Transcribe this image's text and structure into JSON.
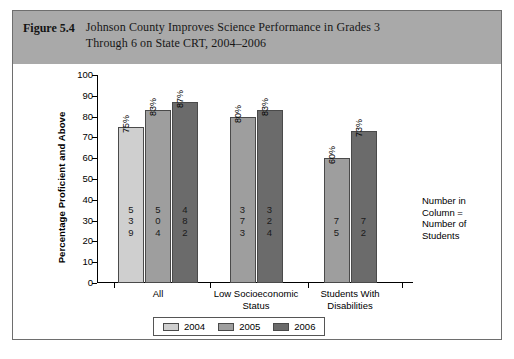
{
  "figure": {
    "number_label": "Figure 5.4",
    "title": "Johnson County Improves Science Performance in Grades 3 Through 6 on State CRT, 2004–2006",
    "title_line1": "Johnson County Improves Science Performance in Grades 3",
    "title_line2": "Through 6 on State CRT, 2004–2006",
    "header_bg": "#a9a9a9"
  },
  "annotation": {
    "line1": "Number in",
    "line2": "Column =",
    "line3": "Number of",
    "line4": "Students"
  },
  "legend": {
    "position": "bottom-center",
    "items": [
      {
        "label": "2004",
        "color": "#cfcfcf"
      },
      {
        "label": "2005",
        "color": "#9e9e9e"
      },
      {
        "label": "2006",
        "color": "#6b6b6b"
      }
    ]
  },
  "chart_data": {
    "type": "bar",
    "title": "Johnson County Improves Science Performance in Grades 3 Through 6 on State CRT, 2004–2006",
    "xlabel": "",
    "ylabel": "Percentage Proficient and Above",
    "ylim": [
      0,
      100
    ],
    "ytick_values": [
      100,
      90,
      80,
      70,
      60,
      50,
      40,
      30,
      20,
      10,
      0
    ],
    "ytick_labels": [
      "100",
      "90",
      "80",
      "70",
      "60",
      "50",
      "40",
      "30",
      "20",
      "10",
      "0"
    ],
    "grid": false,
    "categories": [
      "All",
      "Low Socioeconomic Status",
      "Students With Disabilities"
    ],
    "category_label_lines": [
      [
        "All"
      ],
      [
        "Low Socioeconomic",
        "Status"
      ],
      [
        "Students With",
        "Disabilities"
      ]
    ],
    "series": [
      {
        "name": "2004",
        "color": "#cfcfcf",
        "values": [
          75,
          null,
          null
        ],
        "data_labels": [
          "75%",
          null,
          null
        ],
        "counts": [
          539,
          null,
          null
        ],
        "count_digits": [
          [
            "5",
            "3",
            "9"
          ],
          null,
          null
        ]
      },
      {
        "name": "2005",
        "color": "#9e9e9e",
        "values": [
          83,
          80,
          60
        ],
        "data_labels": [
          "83%",
          "80%",
          "60%"
        ],
        "counts": [
          504,
          373,
          75
        ],
        "count_digits": [
          [
            "5",
            "0",
            "4"
          ],
          [
            "3",
            "7",
            "3"
          ],
          [
            "7",
            "5"
          ]
        ]
      },
      {
        "name": "2006",
        "color": "#6b6b6b",
        "values": [
          87,
          83,
          73
        ],
        "data_labels": [
          "87%",
          "83%",
          "83%"
        ],
        "counts": [
          482,
          324,
          72
        ],
        "count_digits": [
          [
            "4",
            "8",
            "2"
          ],
          [
            "3",
            "2",
            "4"
          ],
          [
            "7",
            "2"
          ]
        ]
      }
    ],
    "bars": [
      {
        "group": "All",
        "series": "2004",
        "value": 75,
        "label": "75%",
        "count": 539,
        "count_digits": [
          "5",
          "3",
          "9"
        ],
        "color": "#cfcfcf"
      },
      {
        "group": "All",
        "series": "2005",
        "value": 83,
        "label": "83%",
        "count": 504,
        "count_digits": [
          "5",
          "0",
          "4"
        ],
        "color": "#9e9e9e"
      },
      {
        "group": "All",
        "series": "2006",
        "value": 87,
        "label": "87%",
        "count": 482,
        "count_digits": [
          "4",
          "8",
          "2"
        ],
        "color": "#6b6b6b"
      },
      {
        "group": "Low Socioeconomic Status",
        "series": "2005",
        "value": 80,
        "label": "80%",
        "count": 373,
        "count_digits": [
          "3",
          "7",
          "3"
        ],
        "color": "#9e9e9e"
      },
      {
        "group": "Low Socioeconomic Status",
        "series": "2006",
        "value": 83,
        "label": "83%",
        "count": 324,
        "count_digits": [
          "3",
          "2",
          "4"
        ],
        "color": "#6b6b6b"
      },
      {
        "group": "Students With Disabilities",
        "series": "2005",
        "value": 60,
        "label": "60%",
        "count": 75,
        "count_digits": [
          "7",
          "5"
        ],
        "color": "#9e9e9e"
      },
      {
        "group": "Students With Disabilities",
        "series": "2006",
        "value": 73,
        "label": "73%",
        "count": 72,
        "count_digits": [
          "7",
          "2"
        ],
        "color": "#6b6b6b"
      }
    ]
  }
}
